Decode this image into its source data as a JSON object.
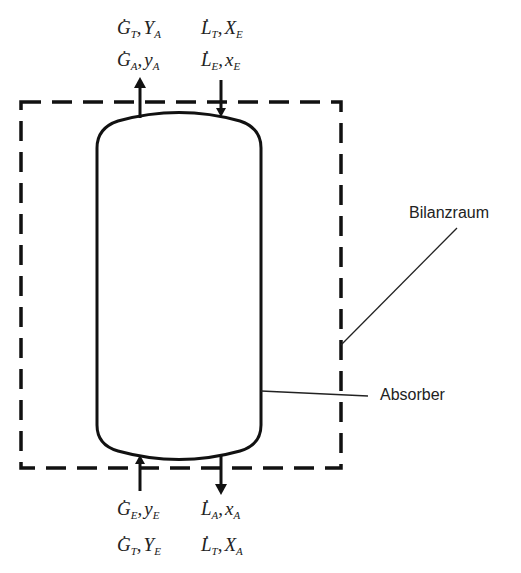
{
  "diagram": {
    "type": "absorber-balance-schematic",
    "colors": {
      "stroke": "#111111",
      "text": "#222222",
      "background": "#ffffff"
    },
    "labels": {
      "boundary": "Bilanzraum",
      "vessel": "Absorber"
    },
    "streams": {
      "top_left": {
        "line1": {
          "sym": "G",
          "sym_sub": "T",
          "var": "Y",
          "var_sub": "A"
        },
        "line2": {
          "sym": "G",
          "sym_sub": "A",
          "var": "y",
          "var_sub": "A"
        },
        "direction": "out-up"
      },
      "top_right": {
        "line1": {
          "sym": "L",
          "sym_sub": "T",
          "var": "X",
          "var_sub": "E"
        },
        "line2": {
          "sym": "L",
          "sym_sub": "E",
          "var": "x",
          "var_sub": "E"
        },
        "direction": "in-down"
      },
      "bottom_left": {
        "line1": {
          "sym": "G",
          "sym_sub": "E",
          "var": "y",
          "var_sub": "E"
        },
        "line2": {
          "sym": "G",
          "sym_sub": "T",
          "var": "Y",
          "var_sub": "E"
        },
        "direction": "in-up"
      },
      "bottom_right": {
        "line1": {
          "sym": "L",
          "sym_sub": "A",
          "var": "x",
          "var_sub": "A"
        },
        "line2": {
          "sym": "L",
          "sym_sub": "T",
          "var": "X",
          "var_sub": "A"
        },
        "direction": "out-down"
      }
    },
    "comma": ",",
    "dot": "·"
  }
}
